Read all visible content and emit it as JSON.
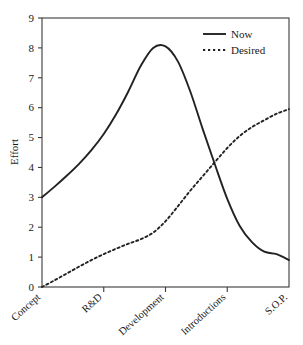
{
  "chart_data": {
    "type": "line",
    "title": "",
    "subtitle": "",
    "xlabel": "",
    "ylabel": "Effort",
    "ylim": [
      0,
      9
    ],
    "yticks": [
      "0",
      "1",
      "2",
      "3",
      "4",
      "5",
      "6",
      "7",
      "8",
      "9"
    ],
    "grid": false,
    "legend_position": "top-right",
    "categories": [
      "Concept",
      "R&D",
      "Development",
      "Introductions",
      "S.O.P."
    ],
    "xtick_labels": [
      "Concept",
      "R&D",
      "Development",
      "Introductions",
      "S.O.P."
    ],
    "series": [
      {
        "name": "Now",
        "style": "solid",
        "x": [
          0.0,
          0.05,
          0.1,
          0.15,
          0.2,
          0.25,
          0.3,
          0.35,
          0.4,
          0.45,
          0.5,
          0.55,
          0.6,
          0.65,
          0.7,
          0.75,
          0.8,
          0.85,
          0.9,
          0.95,
          1.0
        ],
        "values": [
          3.0,
          3.35,
          3.72,
          4.12,
          4.58,
          5.12,
          5.78,
          6.55,
          7.4,
          8.0,
          8.05,
          7.55,
          6.55,
          5.3,
          4.1,
          2.95,
          2.05,
          1.5,
          1.18,
          1.1,
          0.9
        ]
      },
      {
        "name": "Desired",
        "style": "dashed",
        "x": [
          0.0,
          0.05,
          0.1,
          0.15,
          0.2,
          0.25,
          0.3,
          0.35,
          0.4,
          0.45,
          0.5,
          0.55,
          0.6,
          0.65,
          0.7,
          0.75,
          0.8,
          0.85,
          0.9,
          0.95,
          1.0
        ],
        "values": [
          0.0,
          0.22,
          0.45,
          0.68,
          0.9,
          1.1,
          1.28,
          1.45,
          1.6,
          1.82,
          2.2,
          2.7,
          3.22,
          3.7,
          4.18,
          4.65,
          5.05,
          5.35,
          5.58,
          5.8,
          5.95
        ]
      }
    ],
    "annotations": [
      {
        "label": "crossing",
        "x": 0.7,
        "y": 4.1
      }
    ],
    "colors": {
      "now": "#222222",
      "desired": "#222222",
      "axis": "#3a3a3a",
      "background": "#ffffff",
      "text": "#1a1a1a"
    }
  },
  "legend": {
    "entries": [
      {
        "label": "Now"
      },
      {
        "label": "Desired"
      }
    ]
  }
}
